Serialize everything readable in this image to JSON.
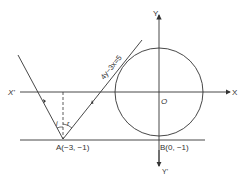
{
  "diagram": {
    "axes": {
      "x_positive_label": "X",
      "x_negative_label": "X'",
      "y_positive_label": "Y",
      "y_negative_label": "Y'",
      "origin_label": "O"
    },
    "points": {
      "A": "A(−3, −1)",
      "B": "B(0, −1)"
    },
    "line_label": "4y−3x=5",
    "angles": {
      "incidence": "i",
      "reflection": "r"
    },
    "colors": {
      "stroke": "#333333",
      "background": "#ffffff"
    }
  }
}
